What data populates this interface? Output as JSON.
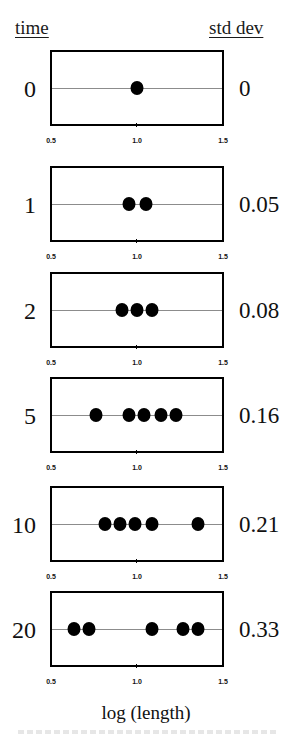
{
  "headers": {
    "left": "time",
    "right": "std dev"
  },
  "x_axis": {
    "label": "log (length)",
    "ticks": [
      "0.5",
      "1.0",
      "1.5"
    ],
    "min": 0.5,
    "max": 1.5
  },
  "panels": [
    {
      "time": "0",
      "std_dev": "0",
      "points": [
        1.0
      ]
    },
    {
      "time": "1",
      "std_dev": "0.05",
      "points": [
        0.95,
        1.05
      ]
    },
    {
      "time": "2",
      "std_dev": "0.08",
      "points": [
        0.91,
        1.0,
        1.09
      ]
    },
    {
      "time": "5",
      "std_dev": "0.16",
      "points": [
        0.76,
        0.95,
        1.04,
        1.14,
        1.23
      ]
    },
    {
      "time": "10",
      "std_dev": "0.21",
      "points": [
        0.81,
        0.9,
        0.99,
        1.09,
        1.36
      ]
    },
    {
      "time": "20",
      "std_dev": "0.33",
      "points": [
        0.63,
        0.72,
        1.09,
        1.27,
        1.36
      ]
    }
  ],
  "colors": {
    "dot": "#000000",
    "box_border": "#000000",
    "midline": "#8c8c8c"
  },
  "chart_data": {
    "type": "scatter",
    "title": "",
    "xlabel": "log (length)",
    "ylabel": "time",
    "right_label": "std dev",
    "xlim": [
      0.5,
      1.5
    ],
    "x_ticks": [
      0.5,
      1.0,
      1.5
    ],
    "grid": false,
    "layout": "6 stacked 1-D strip plots (one per time point), dots on a horizontal center line",
    "series": [
      {
        "name": "time 0",
        "std_dev": 0,
        "x": [
          1.0
        ]
      },
      {
        "name": "time 1",
        "std_dev": 0.05,
        "x": [
          0.95,
          1.05
        ]
      },
      {
        "name": "time 2",
        "std_dev": 0.08,
        "x": [
          0.91,
          1.0,
          1.09
        ]
      },
      {
        "name": "time 5",
        "std_dev": 0.16,
        "x": [
          0.76,
          0.95,
          1.04,
          1.14,
          1.23
        ]
      },
      {
        "name": "time 10",
        "std_dev": 0.21,
        "x": [
          0.81,
          0.9,
          0.99,
          1.09,
          1.36
        ]
      },
      {
        "name": "time 20",
        "std_dev": 0.33,
        "x": [
          0.63,
          0.72,
          1.09,
          1.27,
          1.36
        ]
      }
    ]
  }
}
